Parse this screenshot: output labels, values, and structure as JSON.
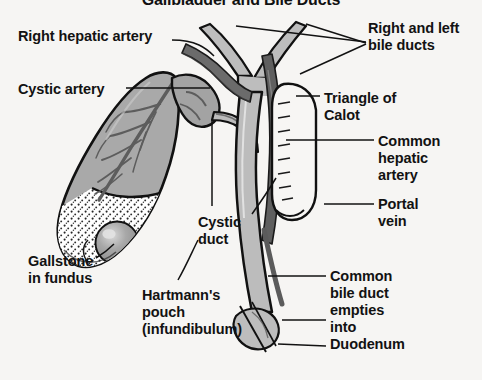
{
  "figure": {
    "title": "Gallbladder and Bile Ducts",
    "background_color": "#f6f5f3",
    "ink_color": "#121212",
    "palette": {
      "organ_fill": "#a9a9a9",
      "duct_fill": "#b8b8b8",
      "vessel_dark": "#6e6e6e",
      "vessel_darker": "#4a4a4a",
      "stone_fill": "#9e9e9e",
      "stone_highlight": "#d8d8d8",
      "wall_outline": "#111111",
      "sediment": "#2a2a2a",
      "duodenum_fill": "#bdbdbd"
    },
    "labels": [
      {
        "id": "right-hepatic-artery",
        "text": "Right hepatic artery",
        "x": 18,
        "y": 28,
        "align": "left"
      },
      {
        "id": "right-and-left-bile-ducts",
        "text": "Right and left\nbile ducts",
        "x": 368,
        "y": 20,
        "align": "left"
      },
      {
        "id": "cystic-artery",
        "text": "Cystic artery",
        "x": 18,
        "y": 81,
        "align": "left"
      },
      {
        "id": "triangle-of-calot",
        "text": "Triangle of\nCalot",
        "x": 324,
        "y": 90,
        "align": "left"
      },
      {
        "id": "common-hepatic-artery",
        "text": "Common\nhepatic\nartery",
        "x": 378,
        "y": 133,
        "align": "left"
      },
      {
        "id": "portal-vein",
        "text": "Portal\nvein",
        "x": 378,
        "y": 196,
        "align": "left"
      },
      {
        "id": "cystic-duct",
        "text": "Cystic\nduct",
        "x": 198,
        "y": 214,
        "align": "left"
      },
      {
        "id": "gallstone-in-fundus",
        "text": "Gallstone\nin fundus",
        "x": 28,
        "y": 253,
        "align": "left"
      },
      {
        "id": "hartmanns-pouch",
        "text": "Hartmann's\npouch\n(infundibulum)",
        "x": 142,
        "y": 287,
        "align": "left"
      },
      {
        "id": "common-bile-duct-duodenum",
        "text": "Common\nbile duct\nempties\ninto\nDuodenum",
        "x": 330,
        "y": 268,
        "align": "left"
      }
    ],
    "structures": [
      {
        "id": "gallbladder-body",
        "name": "Gallbladder body"
      },
      {
        "id": "gallbladder-fundus",
        "name": "Fundus with biliary sediment"
      },
      {
        "id": "gallstone",
        "name": "Gallstone in fundus"
      },
      {
        "id": "hartmanns-pouch-neck",
        "name": "Hartmann's pouch / infundibulum"
      },
      {
        "id": "cystic-duct-structure",
        "name": "Cystic duct"
      },
      {
        "id": "cystic-artery-vessel",
        "name": "Cystic artery"
      },
      {
        "id": "right-hepatic-artery-vessel",
        "name": "Right hepatic artery"
      },
      {
        "id": "right-left-hepatic-ducts",
        "name": "Right and left hepatic bile ducts"
      },
      {
        "id": "common-hepatic-duct",
        "name": "Common hepatic duct"
      },
      {
        "id": "common-bile-duct",
        "name": "Common bile duct"
      },
      {
        "id": "common-hepatic-artery-vessel",
        "name": "Common hepatic artery"
      },
      {
        "id": "portal-vein-vessel",
        "name": "Portal vein"
      },
      {
        "id": "duodenum",
        "name": "Duodenum"
      }
    ]
  }
}
